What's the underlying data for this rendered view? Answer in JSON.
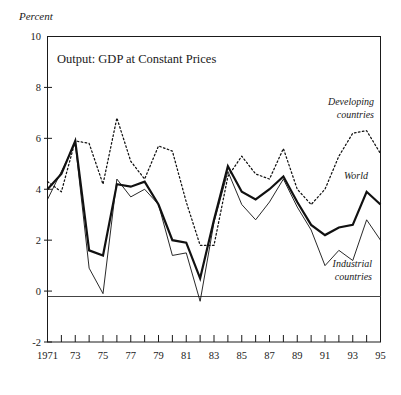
{
  "chart_data": {
    "type": "line",
    "title": "Output: GDP at Constant Prices",
    "ylabel": "Percent",
    "xlabel": "",
    "ylim": [
      -2,
      10
    ],
    "xlim": [
      1971,
      1995
    ],
    "grid": false,
    "legend_position": "inline-annotations",
    "y_ticks": [
      "10",
      "8",
      "6",
      "4",
      "2",
      "0",
      "-2"
    ],
    "y_tick_values": [
      10,
      8,
      6,
      4,
      2,
      0,
      -2
    ],
    "x_ticks": [
      "1971",
      "73",
      "75",
      "77",
      "79",
      "81",
      "83",
      "85",
      "87",
      "89",
      "91",
      "93",
      "95"
    ],
    "x_tick_values": [
      1971,
      1973,
      1975,
      1977,
      1979,
      1981,
      1983,
      1985,
      1987,
      1989,
      1991,
      1993,
      1995
    ],
    "x": [
      1971,
      1972,
      1973,
      1974,
      1975,
      1976,
      1977,
      1978,
      1979,
      1980,
      1981,
      1982,
      1983,
      1984,
      1985,
      1986,
      1987,
      1988,
      1989,
      1990,
      1991,
      1992,
      1993,
      1994,
      1995
    ],
    "series": [
      {
        "name": "World",
        "style": "thick-solid",
        "values": [
          4.0,
          4.6,
          5.9,
          1.6,
          1.4,
          4.2,
          4.1,
          4.3,
          3.4,
          2.0,
          1.9,
          0.5,
          2.8,
          4.9,
          3.9,
          3.6,
          4.0,
          4.5,
          3.5,
          2.6,
          2.2,
          2.5,
          2.6,
          3.9,
          3.4
        ]
      },
      {
        "name": "Industrial countries",
        "style": "thin-solid",
        "values": [
          3.6,
          4.7,
          5.8,
          0.9,
          -0.1,
          4.4,
          3.7,
          4.0,
          3.4,
          1.4,
          1.5,
          -0.4,
          2.7,
          4.7,
          3.4,
          2.8,
          3.5,
          4.4,
          3.3,
          2.4,
          1.0,
          1.6,
          1.2,
          2.8,
          2.0
        ]
      },
      {
        "name": "Developing countries",
        "style": "dotted",
        "values": [
          4.3,
          3.9,
          5.9,
          5.8,
          4.2,
          6.8,
          5.1,
          4.4,
          5.7,
          5.5,
          3.5,
          1.8,
          1.8,
          4.5,
          5.3,
          4.6,
          4.4,
          5.6,
          4.0,
          3.4,
          4.0,
          5.3,
          6.2,
          6.3,
          5.4
        ]
      }
    ],
    "annotations": [
      {
        "text_line1": "Developing",
        "text_line2": "countries",
        "series": "Developing countries"
      },
      {
        "text_line1": "World",
        "text_line2": "",
        "series": "World"
      },
      {
        "text_line1": "Industrial",
        "text_line2": "countries",
        "series": "Industrial countries"
      }
    ]
  },
  "labels": {
    "y_axis_title": "Percent",
    "plot_title": "Output: GDP at Constant Prices",
    "developing_line1": "Developing",
    "developing_line2": "countries",
    "world": "World",
    "industrial_line1": "Industrial",
    "industrial_line2": "countries"
  }
}
